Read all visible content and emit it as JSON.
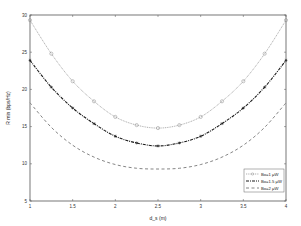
{
  "chart_data": {
    "type": "line",
    "title": "",
    "xlabel": "d_s (m)",
    "ylabel": "R min (bps/Hz)",
    "xlim": [
      1,
      4
    ],
    "ylim": [
      5,
      30
    ],
    "x_ticks": [
      "1",
      "1.5",
      "2",
      "2.5",
      "3",
      "3.5",
      "4"
    ],
    "y_ticks": [
      "5",
      "10",
      "15",
      "20",
      "25",
      "30"
    ],
    "grid": false,
    "legend_position": "lower right",
    "x": [
      1.0,
      1.25,
      1.5,
      1.75,
      2.0,
      2.25,
      2.5,
      2.75,
      3.0,
      3.25,
      3.5,
      3.75,
      4.0
    ],
    "series": [
      {
        "name": "Bo=1 μW",
        "style": "dotted-circle",
        "color": "#8a8a8a",
        "values": [
          29.3,
          24.8,
          21.1,
          18.4,
          16.3,
          15.2,
          14.8,
          15.2,
          16.3,
          18.4,
          21.1,
          24.8,
          29.3
        ]
      },
      {
        "name": "Bo=1.5 μW",
        "style": "dashdot-star",
        "color": "#1a1a1a",
        "values": [
          23.9,
          20.3,
          17.5,
          15.4,
          13.7,
          12.8,
          12.4,
          12.8,
          13.7,
          15.4,
          17.5,
          20.3,
          23.9
        ]
      },
      {
        "name": "Bo=2 μW",
        "style": "dashed",
        "color": "#777777",
        "values": [
          18.2,
          14.9,
          12.5,
          10.9,
          9.9,
          9.4,
          9.3,
          9.4,
          9.9,
          10.9,
          12.5,
          14.9,
          18.2
        ]
      }
    ]
  }
}
